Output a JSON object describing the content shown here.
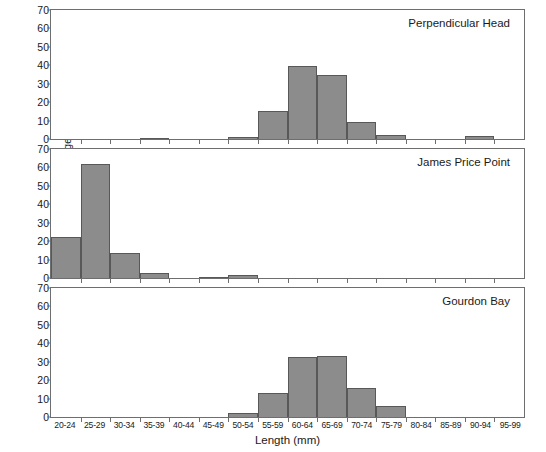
{
  "chart_data": {
    "type": "bar",
    "title": "",
    "xlabel": "Length (mm)",
    "ylabel": "Percentage (%)",
    "ylim": [
      0,
      70
    ],
    "yticks": [
      0,
      10,
      20,
      30,
      40,
      50,
      60,
      70
    ],
    "grid": false,
    "legend": "none",
    "orientation": "stacked-panels",
    "categories": [
      "20-24",
      "25-29",
      "30-34",
      "35-39",
      "40-44",
      "45-49",
      "50-54",
      "55-59",
      "60-64",
      "65-69",
      "70-74",
      "75-79",
      "80-84",
      "85-89",
      "90-94",
      "95-99"
    ],
    "panels": [
      {
        "name": "Perpendicular Head",
        "values": [
          0,
          0,
          0,
          0.7,
          0,
          0,
          1.0,
          15.0,
          39.5,
          35.0,
          9.0,
          2.0,
          0,
          0,
          1.5,
          0
        ]
      },
      {
        "name": "James Price Point",
        "values": [
          22.0,
          62.0,
          13.5,
          2.5,
          0,
          0.7,
          1.5,
          0,
          0,
          0,
          0,
          0,
          0,
          0,
          0,
          0
        ]
      },
      {
        "name": "Gourdon Bay",
        "values": [
          0,
          0,
          0,
          0,
          0,
          0,
          2.0,
          13.0,
          32.5,
          33.0,
          16.0,
          6.0,
          0,
          0,
          0,
          0
        ]
      }
    ],
    "colors": {
      "bar_fill": "#8c8c8c",
      "bar_stroke": "#585858",
      "axis": "#6e6e6e",
      "text": "#1a1a1a",
      "background": "#ffffff"
    }
  }
}
